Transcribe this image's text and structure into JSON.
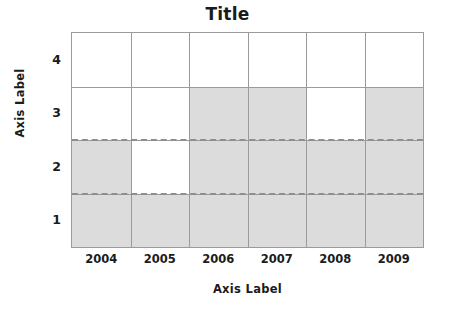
{
  "chart_data": {
    "type": "bar",
    "title": "Title",
    "xlabel": "Axis Label",
    "ylabel": "Axis Label",
    "categories": [
      "2004",
      "2005",
      "2006",
      "2007",
      "2008",
      "2009"
    ],
    "values": [
      2.5,
      1.5,
      3.5,
      3.5,
      2.5,
      3.5
    ],
    "series": [
      {
        "name": "series-1",
        "values": [
          2.5,
          1.5,
          3.5,
          3.5,
          2.5,
          3.5
        ]
      }
    ],
    "ytick_labels": [
      "1",
      "2",
      "3",
      "4"
    ],
    "ytick_values": [
      1,
      2,
      3,
      4
    ],
    "ylim": [
      0.5,
      4.5
    ],
    "grid": true,
    "gridlines_solid_y": [
      1.5,
      2.5,
      3.5
    ],
    "reference_lines_dashed_y": [
      1.5,
      2.5
    ],
    "legend": null,
    "bar_color": "#dcdcdc",
    "grid_color": "#9a9a9a",
    "dash_color": "#8e8e8e",
    "text_color": "#1b1b1b",
    "background": "#ffffff"
  }
}
